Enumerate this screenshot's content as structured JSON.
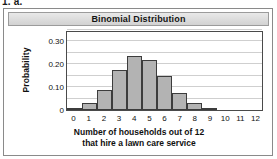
{
  "problem": {
    "label": "1. a."
  },
  "figure": {
    "title": "Binomial Distribution"
  },
  "chart_data": {
    "type": "bar",
    "title": "Binomial Distribution",
    "xlabel_line1": "Number of households out of 12",
    "xlabel_line2": "that hire a lawn care service",
    "ylabel": "Probability",
    "categories": [
      "0",
      "1",
      "2",
      "3",
      "4",
      "5",
      "6",
      "7",
      "8",
      "9",
      "10",
      "11",
      "12"
    ],
    "values": [
      0.004,
      0.029,
      0.089,
      0.175,
      0.235,
      0.219,
      0.15,
      0.075,
      0.029,
      0.008,
      0.001,
      0.0,
      0.0
    ],
    "ylim": [
      0,
      0.35
    ],
    "ytick_values": [
      0,
      0.1,
      0.2,
      0.3
    ],
    "ytick_labels": [
      "0",
      "0.10",
      "0.20",
      "0.30"
    ],
    "gridline_values": [
      0.05,
      0.1,
      0.15,
      0.2,
      0.25,
      0.3,
      0.35
    ],
    "grid": true,
    "legend": "none",
    "bar_fill_color": "#b3b3b3",
    "bar_edge_color": "#3c3c3c"
  }
}
